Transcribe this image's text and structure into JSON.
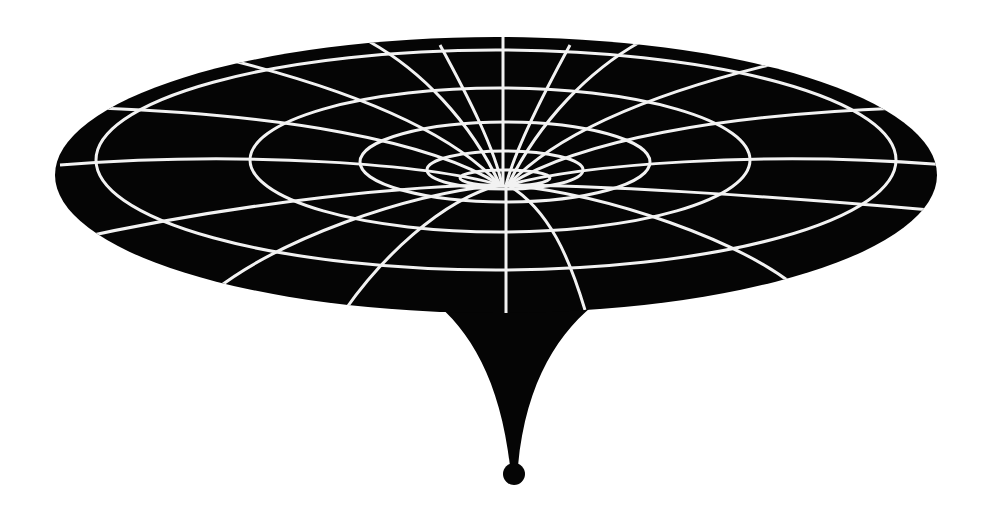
{
  "diagram": {
    "type": "gravity-well",
    "colors": {
      "background": "#ffffff",
      "fabric": "#050505",
      "grid": "#f2f2f2"
    },
    "disk": {
      "cx": 496,
      "cy": 175,
      "rx": 441,
      "ry": 138
    },
    "rings": 4,
    "radial_lines": 16,
    "singularity": {
      "cx": 514,
      "cy": 474,
      "r": 11
    }
  }
}
